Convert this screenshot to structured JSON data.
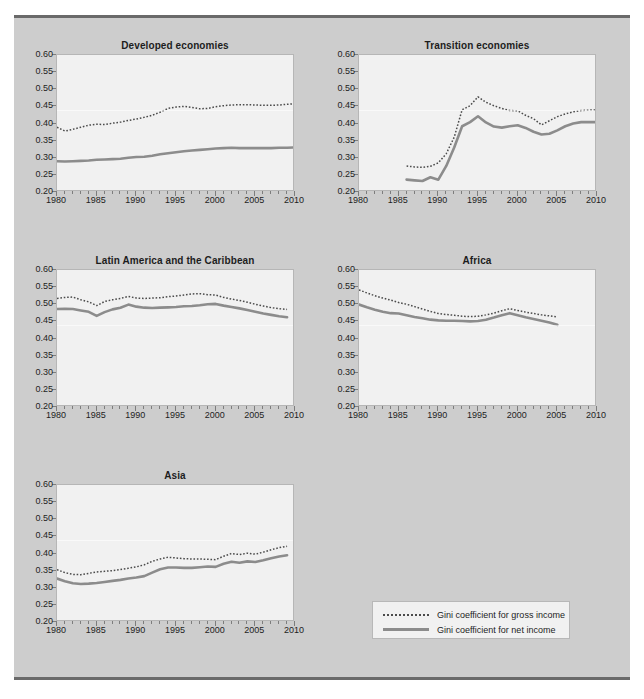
{
  "legend": {
    "entries": [
      {
        "key": "dotted",
        "label": "Gini coefficient for gross income"
      },
      {
        "key": "solid",
        "label": "Gini coefficient for net income"
      }
    ]
  },
  "axis": {
    "y_ticks": [
      "0.20",
      "0.25",
      "0.30",
      "0.35",
      "0.40",
      "0.45",
      "0.50",
      "0.55",
      "0.60"
    ],
    "x_ticks": [
      "1980",
      "1985",
      "1990",
      "1995",
      "2000",
      "2005",
      "2010"
    ]
  },
  "colors": {
    "panel_background": "#cdcdcd",
    "plot_background": "#f1f1f1",
    "panel_rule": "#6a6a6a",
    "gross_income_line": "#4b4b4b",
    "net_income_line": "#8c8c8c"
  },
  "chart_data": [
    {
      "type": "line",
      "title": "Developed economies",
      "xlabel": "",
      "ylabel": "",
      "xlim": [
        1980,
        2010
      ],
      "ylim": [
        0.2,
        0.6
      ],
      "grid": false,
      "legend_position": "external",
      "x": [
        1980,
        1981,
        1982,
        1983,
        1984,
        1985,
        1986,
        1987,
        1988,
        1989,
        1990,
        1991,
        1992,
        1993,
        1994,
        1995,
        1996,
        1997,
        1998,
        1999,
        2000,
        2001,
        2002,
        2003,
        2004,
        2005,
        2006,
        2007,
        2008,
        2009,
        2010
      ],
      "series": [
        {
          "name": "Gini coefficient for gross income",
          "style": "dotted",
          "values": [
            0.389,
            0.378,
            0.383,
            0.389,
            0.395,
            0.398,
            0.397,
            0.401,
            0.404,
            0.409,
            0.413,
            0.418,
            0.424,
            0.433,
            0.444,
            0.448,
            0.45,
            0.447,
            0.443,
            0.444,
            0.449,
            0.452,
            0.454,
            0.455,
            0.455,
            0.454,
            0.453,
            0.453,
            0.454,
            0.456,
            0.458
          ]
        },
        {
          "name": "Gini coefficient for net income",
          "style": "solid",
          "values": [
            0.29,
            0.289,
            0.29,
            0.291,
            0.292,
            0.294,
            0.295,
            0.296,
            0.297,
            0.3,
            0.302,
            0.303,
            0.306,
            0.31,
            0.313,
            0.316,
            0.319,
            0.321,
            0.323,
            0.325,
            0.327,
            0.328,
            0.329,
            0.328,
            0.328,
            0.328,
            0.328,
            0.328,
            0.329,
            0.329,
            0.33
          ]
        }
      ]
    },
    {
      "type": "line",
      "title": "Transition  economies",
      "xlabel": "",
      "ylabel": "",
      "xlim": [
        1980,
        2010
      ],
      "ylim": [
        0.2,
        0.6
      ],
      "grid": false,
      "legend_position": "external",
      "x": [
        1986,
        1987,
        1988,
        1989,
        1990,
        1991,
        1992,
        1993,
        1994,
        1995,
        1996,
        1997,
        1998,
        1999,
        2000,
        2001,
        2002,
        2003,
        2004,
        2005,
        2006,
        2007,
        2008,
        2009,
        2010
      ],
      "series": [
        {
          "name": "Gini coefficient for gross income",
          "style": "dotted",
          "values": [
            0.276,
            0.273,
            0.272,
            0.275,
            0.285,
            0.312,
            0.36,
            0.44,
            0.452,
            0.478,
            0.462,
            0.452,
            0.444,
            0.438,
            0.437,
            0.424,
            0.414,
            0.396,
            0.408,
            0.42,
            0.428,
            0.434,
            0.438,
            0.439,
            0.44
          ]
        },
        {
          "name": "Gini coefficient for net income",
          "style": "solid",
          "values": [
            0.236,
            0.234,
            0.232,
            0.243,
            0.236,
            0.276,
            0.33,
            0.392,
            0.404,
            0.421,
            0.403,
            0.391,
            0.388,
            0.392,
            0.395,
            0.387,
            0.376,
            0.368,
            0.37,
            0.38,
            0.392,
            0.4,
            0.404,
            0.404,
            0.404
          ]
        }
      ]
    },
    {
      "type": "line",
      "title": "Latin America and the Caribbean",
      "xlabel": "",
      "ylabel": "",
      "xlim": [
        1980,
        2010
      ],
      "ylim": [
        0.2,
        0.6
      ],
      "grid": false,
      "legend_position": "external",
      "x": [
        1980,
        1981,
        1982,
        1983,
        1984,
        1985,
        1986,
        1987,
        1988,
        1989,
        1990,
        1991,
        1992,
        1993,
        1994,
        1995,
        1996,
        1997,
        1998,
        1999,
        2000,
        2001,
        2002,
        2003,
        2004,
        2005,
        2006,
        2007,
        2008,
        2009
      ],
      "series": [
        {
          "name": "Gini coefficient for gross income",
          "style": "dotted",
          "values": [
            0.517,
            0.52,
            0.521,
            0.513,
            0.507,
            0.496,
            0.508,
            0.513,
            0.517,
            0.523,
            0.518,
            0.517,
            0.518,
            0.519,
            0.522,
            0.524,
            0.527,
            0.53,
            0.531,
            0.528,
            0.527,
            0.52,
            0.515,
            0.511,
            0.506,
            0.5,
            0.495,
            0.49,
            0.487,
            0.485
          ]
        },
        {
          "name": "Gini coefficient for net income",
          "style": "solid",
          "values": [
            0.486,
            0.487,
            0.486,
            0.482,
            0.478,
            0.466,
            0.477,
            0.485,
            0.49,
            0.499,
            0.493,
            0.49,
            0.489,
            0.49,
            0.491,
            0.492,
            0.494,
            0.495,
            0.497,
            0.5,
            0.501,
            0.496,
            0.492,
            0.488,
            0.483,
            0.478,
            0.473,
            0.469,
            0.465,
            0.462
          ]
        }
      ]
    },
    {
      "type": "line",
      "title": "Africa",
      "xlabel": "",
      "ylabel": "",
      "xlim": [
        1980,
        2010
      ],
      "ylim": [
        0.2,
        0.6
      ],
      "grid": false,
      "legend_position": "external",
      "x": [
        1980,
        1981,
        1982,
        1983,
        1984,
        1985,
        1986,
        1987,
        1988,
        1989,
        1990,
        1991,
        1992,
        1993,
        1994,
        1995,
        1996,
        1997,
        1998,
        1999,
        2000,
        2001,
        2002,
        2003,
        2004,
        2005
      ],
      "series": [
        {
          "name": "Gini coefficient for gross income",
          "style": "dotted",
          "values": [
            0.542,
            0.533,
            0.525,
            0.518,
            0.512,
            0.505,
            0.5,
            0.493,
            0.486,
            0.479,
            0.473,
            0.47,
            0.468,
            0.465,
            0.464,
            0.465,
            0.469,
            0.474,
            0.481,
            0.487,
            0.482,
            0.477,
            0.473,
            0.469,
            0.466,
            0.463
          ]
        },
        {
          "name": "Gini coefficient for net income",
          "style": "solid",
          "values": [
            0.499,
            0.491,
            0.484,
            0.478,
            0.474,
            0.473,
            0.468,
            0.463,
            0.459,
            0.455,
            0.453,
            0.452,
            0.452,
            0.451,
            0.45,
            0.451,
            0.455,
            0.461,
            0.468,
            0.474,
            0.468,
            0.462,
            0.457,
            0.452,
            0.447,
            0.44
          ]
        }
      ]
    },
    {
      "type": "line",
      "title": "Asia",
      "xlabel": "",
      "ylabel": "",
      "xlim": [
        1980,
        2010
      ],
      "ylim": [
        0.2,
        0.6
      ],
      "grid": false,
      "legend_position": "external",
      "x": [
        1980,
        1981,
        1982,
        1983,
        1984,
        1985,
        1986,
        1987,
        1988,
        1989,
        1990,
        1991,
        1992,
        1993,
        1994,
        1995,
        1996,
        1997,
        1998,
        1999,
        2000,
        2001,
        2002,
        2003,
        2004,
        2005,
        2006,
        2007,
        2008,
        2009
      ],
      "series": [
        {
          "name": "Gini coefficient for gross income",
          "style": "dotted",
          "values": [
            0.353,
            0.344,
            0.339,
            0.338,
            0.342,
            0.346,
            0.348,
            0.35,
            0.353,
            0.357,
            0.361,
            0.367,
            0.377,
            0.384,
            0.389,
            0.387,
            0.385,
            0.384,
            0.384,
            0.383,
            0.382,
            0.392,
            0.4,
            0.397,
            0.401,
            0.398,
            0.404,
            0.411,
            0.417,
            0.421
          ]
        },
        {
          "name": "Gini coefficient for net income",
          "style": "solid",
          "values": [
            0.327,
            0.319,
            0.313,
            0.311,
            0.312,
            0.314,
            0.317,
            0.32,
            0.323,
            0.327,
            0.33,
            0.334,
            0.344,
            0.354,
            0.359,
            0.359,
            0.358,
            0.358,
            0.36,
            0.362,
            0.361,
            0.37,
            0.376,
            0.373,
            0.377,
            0.375,
            0.38,
            0.386,
            0.391,
            0.395
          ]
        }
      ]
    }
  ]
}
